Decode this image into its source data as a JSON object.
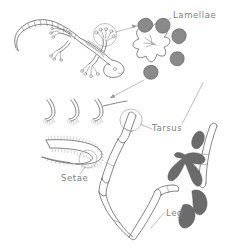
{
  "figure": {
    "background_color": "#ffffff",
    "ink_color": "#6e6e6e",
    "label_color": "#7d7d7d",
    "shading_color": "#8a8a8a",
    "style": "pencil line drawing",
    "width": 238,
    "height": 252
  },
  "labels": {
    "lamellae": "Lamellae",
    "tarsus": "Tarsus",
    "setae": "Setae",
    "leg": "Leg"
  },
  "panels": [
    {
      "id": "gecko-habitus",
      "name": "whole gecko dorsal view",
      "position": "top-left",
      "description": "Gecko drawn from above with long segmented curved tail, four splayed limbs with spread toes, head at right"
    },
    {
      "id": "foot-magnified",
      "name": "magnified gecko foot",
      "position": "top-right",
      "description": "Enlarged foot with five radiating toes, each tipped with a dark shaded lamellar pad",
      "toe_count": 5,
      "label": "Lamellae"
    },
    {
      "id": "setae-hooks",
      "name": "seta spatulae detail",
      "position": "middle-left",
      "description": "Three hook-shaped seta tips curving to the right, each with fine branching tips",
      "hook_count": 3
    },
    {
      "id": "lamella-brush",
      "name": "single lamella with setae brush",
      "position": "lower-left",
      "description": "Hairpin-shaped lamella fringed with dense fine setae bristles",
      "label": "Setae"
    },
    {
      "id": "leg-anatomy",
      "name": "segmented leg",
      "position": "right",
      "description": "Jointed leg with femur, tibia and tarsus segments, dark branching claws at lower right",
      "labels": [
        "Tarsus",
        "Leg"
      ]
    }
  ],
  "callouts": [
    {
      "id": "callout-foot",
      "name": "gecko foot magnification circle",
      "from": "gecko front foot",
      "to": "magnified foot",
      "shape": "circle"
    },
    {
      "id": "callout-lamella",
      "name": "lamella to setae magnification",
      "from": "lamellar pad",
      "to": "setae hooks",
      "shape": "arrow"
    },
    {
      "id": "callout-tarsus",
      "name": "tarsus magnification circle",
      "from": "leg tarsus tip",
      "to": "Tarsus label",
      "shape": "circle"
    },
    {
      "id": "callout-setae-brush",
      "name": "setae brush magnification circle",
      "from": "lamella brush",
      "to": "Setae label",
      "shape": "circle"
    }
  ]
}
